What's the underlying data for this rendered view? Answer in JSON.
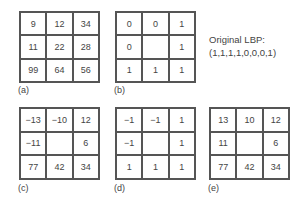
{
  "panels": {
    "a": {
      "label": "(a)",
      "cells": [
        "9",
        "12",
        "34",
        "11",
        "22",
        "28",
        "99",
        "64",
        "56"
      ]
    },
    "b": {
      "label": "(b)",
      "cells": [
        "0",
        "0",
        "1",
        "0",
        "",
        "1",
        "1",
        "1",
        "1"
      ]
    },
    "c": {
      "label": "(c)",
      "cells": [
        "−13",
        "−10",
        "12",
        "−11",
        "",
        "6",
        "77",
        "42",
        "34"
      ]
    },
    "d": {
      "label": "(d)",
      "cells": [
        "−1",
        "−1",
        "1",
        "−1",
        "",
        "1",
        "1",
        "1",
        "1"
      ]
    },
    "e": {
      "label": "(e)",
      "cells": [
        "13",
        "10",
        "12",
        "11",
        "",
        "6",
        "77",
        "42",
        "34"
      ]
    }
  },
  "annotation": {
    "line1": "Original LBP:",
    "line2": "(1,1,1,1,0,0,0,1)"
  }
}
